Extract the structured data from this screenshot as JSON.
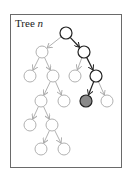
{
  "title": {
    "prefix": "Tree ",
    "variable": "n"
  },
  "colors": {
    "frame": "#6a6a6a",
    "light_edge": "#a8a8a8",
    "dark_edge": "#222222",
    "light_node_stroke": "#a8a8a8",
    "dark_node_stroke": "#222222",
    "highlight_fill": "#8a8a8a",
    "node_fill": "#ffffff"
  },
  "tree": {
    "node_radius": 6,
    "nodes": [
      {
        "id": "root",
        "x": 66,
        "y": 33,
        "style": "dark"
      },
      {
        "id": "n1",
        "x": 42,
        "y": 52,
        "style": "light"
      },
      {
        "id": "n2",
        "x": 84,
        "y": 52,
        "style": "dark"
      },
      {
        "id": "n3",
        "x": 30,
        "y": 76,
        "style": "light"
      },
      {
        "id": "n4",
        "x": 53,
        "y": 76,
        "style": "light"
      },
      {
        "id": "n5",
        "x": 75,
        "y": 76,
        "style": "light"
      },
      {
        "id": "n6",
        "x": 96,
        "y": 76,
        "style": "dark"
      },
      {
        "id": "n7",
        "x": 41,
        "y": 101,
        "style": "light"
      },
      {
        "id": "n8",
        "x": 64,
        "y": 101,
        "style": "light"
      },
      {
        "id": "n9",
        "x": 86,
        "y": 101,
        "style": "highlight"
      },
      {
        "id": "n10",
        "x": 107,
        "y": 101,
        "style": "light"
      },
      {
        "id": "n11",
        "x": 30,
        "y": 125,
        "style": "light"
      },
      {
        "id": "n12",
        "x": 52,
        "y": 125,
        "style": "light"
      },
      {
        "id": "n13",
        "x": 41,
        "y": 149,
        "style": "light"
      },
      {
        "id": "n14",
        "x": 64,
        "y": 149,
        "style": "light"
      }
    ],
    "edges": [
      {
        "from": "root",
        "to": "n1",
        "style": "light"
      },
      {
        "from": "root",
        "to": "n2",
        "style": "dark"
      },
      {
        "from": "n1",
        "to": "n3",
        "style": "light"
      },
      {
        "from": "n1",
        "to": "n4",
        "style": "light"
      },
      {
        "from": "n2",
        "to": "n5",
        "style": "light"
      },
      {
        "from": "n2",
        "to": "n6",
        "style": "dark"
      },
      {
        "from": "n4",
        "to": "n7",
        "style": "light"
      },
      {
        "from": "n4",
        "to": "n8",
        "style": "light"
      },
      {
        "from": "n6",
        "to": "n9",
        "style": "dark"
      },
      {
        "from": "n6",
        "to": "n10",
        "style": "light"
      },
      {
        "from": "n7",
        "to": "n11",
        "style": "light"
      },
      {
        "from": "n7",
        "to": "n12",
        "style": "light"
      },
      {
        "from": "n12",
        "to": "n13",
        "style": "light"
      },
      {
        "from": "n12",
        "to": "n14",
        "style": "light"
      }
    ]
  }
}
